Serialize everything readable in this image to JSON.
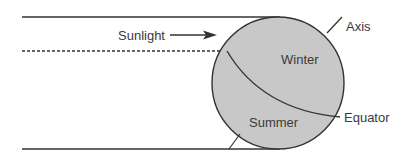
{
  "diagram": {
    "labels": {
      "sunlight": "Sunlight",
      "axis": "Axis",
      "winter": "Winter",
      "summer": "Summer",
      "equator": "Equator"
    },
    "colors": {
      "globe_fill": "#c8c8c8",
      "stroke": "#333333",
      "text": "#3a3a3a",
      "background": "#ffffff"
    },
    "elements": {
      "sunlight_rays": [
        "top-solid-ray",
        "middle-dashed-ray",
        "bottom-solid-ray"
      ],
      "globe": "earth-circle",
      "axis": "tilted-axis-line",
      "terminator": "equator-curve",
      "arrow": "sunlight-direction-arrow"
    }
  }
}
